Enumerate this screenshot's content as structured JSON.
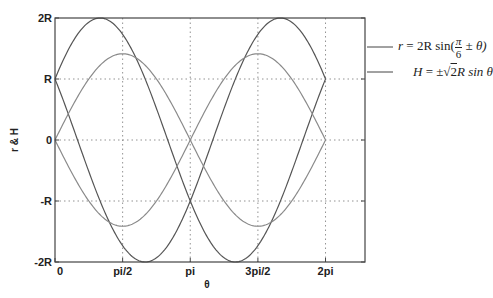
{
  "chart_data": {
    "type": "line",
    "title": "",
    "xlabel": "θ",
    "ylabel": "r & H",
    "xlim": [
      0,
      7.2
    ],
    "ylim": [
      -2,
      2
    ],
    "x_ticks": [
      {
        "value": 0,
        "label": "0"
      },
      {
        "value": 1.5708,
        "label": "pi/2"
      },
      {
        "value": 3.1416,
        "label": "pi"
      },
      {
        "value": 4.7124,
        "label": "3pi/2"
      },
      {
        "value": 6.2832,
        "label": "2pi"
      }
    ],
    "y_ticks": [
      {
        "value": 2,
        "label": "2R"
      },
      {
        "value": 1,
        "label": "R"
      },
      {
        "value": 0,
        "label": "0"
      },
      {
        "value": -1,
        "label": "-R"
      },
      {
        "value": -2,
        "label": "-2R"
      }
    ],
    "grid": true,
    "legend_position": "right-outside",
    "series": [
      {
        "name": "r = 2R sin(π/6 + θ)",
        "formula": "2*sin(pi/6 + t)",
        "color": "#555555",
        "x_range": [
          0,
          6.2832
        ]
      },
      {
        "name": "r = 2R sin(π/6 − θ)",
        "formula": "2*sin(pi/6 - t)",
        "color": "#555555",
        "x_range": [
          0,
          6.2832
        ]
      },
      {
        "name": "H = +√2 R sin θ",
        "formula": "sqrt(2)*sin(t)",
        "color": "#8a8a8a",
        "x_range": [
          0,
          6.2832
        ]
      },
      {
        "name": "H = −√2 R sin θ",
        "formula": "-sqrt(2)*sin(t)",
        "color": "#8a8a8a",
        "x_range": [
          0,
          6.2832
        ]
      }
    ],
    "key_points": {
      "r_plus": [
        [
          0,
          1
        ],
        [
          1.0472,
          2
        ],
        [
          3.1416,
          -1
        ],
        [
          4.1888,
          -2
        ],
        [
          6.2832,
          1
        ]
      ],
      "r_minus": [
        [
          0,
          1
        ],
        [
          2.0944,
          -2
        ],
        [
          3.1416,
          -1
        ],
        [
          5.236,
          2
        ],
        [
          6.2832,
          1
        ]
      ],
      "H_plus": [
        [
          0,
          0
        ],
        [
          1.5708,
          1.414
        ],
        [
          3.1416,
          0
        ],
        [
          4.7124,
          -1.414
        ],
        [
          6.2832,
          0
        ]
      ],
      "H_minus": [
        [
          0,
          0
        ],
        [
          1.5708,
          -1.414
        ],
        [
          3.1416,
          0
        ],
        [
          4.7124,
          1.414
        ],
        [
          6.2832,
          0
        ]
      ]
    }
  },
  "legend": {
    "entry1": {
      "lhs": "r",
      "eq": " = 2R sin(",
      "frac_num": "π",
      "frac_den": "6",
      "tail": " ± θ)"
    },
    "entry2": {
      "lhs": "H",
      "eq": " = ±",
      "sqrt": "2",
      "tail": "R sin θ"
    }
  }
}
